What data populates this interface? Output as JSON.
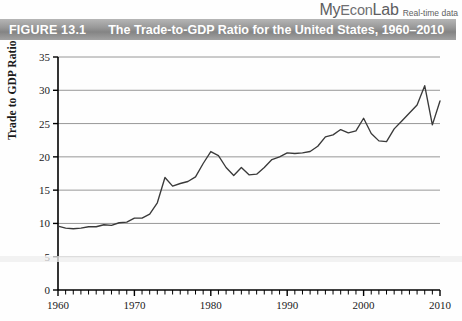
{
  "brand": {
    "logo_my": "My",
    "logo_econ": "Econ",
    "logo_lab": "Lab",
    "logo_text": "MyEconLab",
    "tagline": "Real-time data"
  },
  "figure": {
    "number_label": "FIGURE 13.1",
    "title": "The Trade-to-GDP Ratio for the United States, 1960–2010"
  },
  "colors": {
    "header_gray_light": "#b6b6b6",
    "header_gray_dark": "#848484",
    "title_text": "#ffffff",
    "line": "#3a3a3a",
    "gridline": "#8c8c8c",
    "axis": "#000000",
    "brand_gray": "#6f6f72",
    "background": "#fefefe"
  },
  "chart_data": {
    "type": "line",
    "title": "The Trade-to-GDP Ratio for the United States, 1960–2010",
    "xlabel": "",
    "ylabel": "Trade to GDP Ratio",
    "xlim": [
      1960,
      2010
    ],
    "ylim": [
      0,
      35
    ],
    "yticks": [
      0,
      5,
      10,
      15,
      20,
      25,
      30,
      35
    ],
    "ytick_labels": [
      "0",
      "5",
      "10",
      "15",
      "20",
      "25",
      "30",
      "35"
    ],
    "xticks": [
      1960,
      1970,
      1980,
      1990,
      2000,
      2010
    ],
    "xtick_labels": [
      "1960",
      "1970",
      "1980",
      "1990",
      "2000",
      "2010"
    ],
    "x_minor_tick_step": 1,
    "grid": "horizontal",
    "legend": "none",
    "series": [
      {
        "name": "Trade to GDP Ratio",
        "x": [
          1960,
          1961,
          1962,
          1963,
          1964,
          1965,
          1966,
          1967,
          1968,
          1969,
          1970,
          1971,
          1972,
          1973,
          1974,
          1975,
          1976,
          1977,
          1978,
          1979,
          1980,
          1981,
          1982,
          1983,
          1984,
          1985,
          1986,
          1987,
          1988,
          1989,
          1990,
          1991,
          1992,
          1993,
          1994,
          1995,
          1996,
          1997,
          1998,
          1999,
          2000,
          2001,
          2002,
          2003,
          2004,
          2005,
          2006,
          2007,
          2008,
          2009,
          2010
        ],
        "values": [
          9.6,
          9.3,
          9.2,
          9.3,
          9.5,
          9.5,
          9.8,
          9.7,
          10.1,
          10.2,
          10.8,
          10.8,
          11.4,
          13.1,
          16.9,
          15.6,
          16.0,
          16.3,
          17.0,
          19.0,
          20.8,
          20.2,
          18.4,
          17.2,
          18.4,
          17.3,
          17.4,
          18.4,
          19.6,
          20.0,
          20.6,
          20.5,
          20.6,
          20.8,
          21.6,
          23.0,
          23.3,
          24.1,
          23.6,
          23.9,
          25.8,
          23.5,
          22.4,
          22.3,
          24.2,
          25.4,
          26.6,
          27.8,
          30.7,
          24.8,
          28.4
        ]
      }
    ],
    "annotations": []
  }
}
